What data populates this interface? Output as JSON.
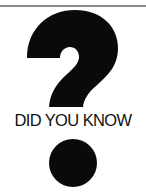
{
  "graphic": {
    "icon": "question-mark-icon",
    "caption": "DID YOU KNOW",
    "colors": {
      "ink": "#0a0a0a",
      "rule": "#8a8a8a",
      "background": "#ffffff"
    }
  }
}
